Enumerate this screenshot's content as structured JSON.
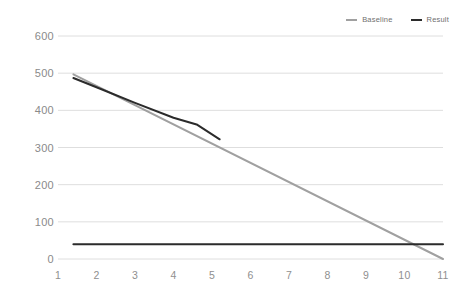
{
  "chart_data": {
    "type": "line",
    "title": "",
    "xlabel": "",
    "ylabel": "",
    "xlim": [
      1,
      11
    ],
    "ylim": [
      0,
      600
    ],
    "grid": true,
    "legend_position": "top-right",
    "yticks": [
      600,
      500,
      400,
      300,
      200,
      100,
      0
    ],
    "xticks": [
      1,
      2,
      3,
      4,
      5,
      6,
      7,
      8,
      9,
      10,
      11
    ],
    "series": [
      {
        "name": "Baseline",
        "color": "#a0a0a0",
        "x": [
          1.4,
          11
        ],
        "values": [
          497,
          0
        ]
      },
      {
        "name": "Result",
        "color": "#2b2b2b",
        "x": [
          1.4,
          2,
          3,
          4,
          4.6,
          5.2
        ],
        "values": [
          487,
          462,
          420,
          380,
          362,
          322
        ]
      },
      {
        "name": "Result",
        "color": "#2b2b2b",
        "x": [
          1.4,
          11
        ],
        "values": [
          40,
          40
        ]
      }
    ]
  },
  "legend": {
    "entries": [
      {
        "label": "Baseline",
        "color": "#a0a0a0"
      },
      {
        "label": "Result",
        "color": "#2b2b2b"
      }
    ]
  },
  "axes": {
    "y_labels": [
      "600",
      "500",
      "400",
      "300",
      "200",
      "100",
      "0"
    ],
    "x_labels": [
      "1",
      "2",
      "3",
      "4",
      "5",
      "6",
      "7",
      "8",
      "9",
      "10",
      "11"
    ]
  },
  "colors": {
    "background": "#ffffff",
    "gridline": "#dedede",
    "baseline_series": "#a0a0a0",
    "result_series": "#2b2b2b",
    "tick_text": "#8a8a8a",
    "legend_text": "#6f6f6f"
  }
}
